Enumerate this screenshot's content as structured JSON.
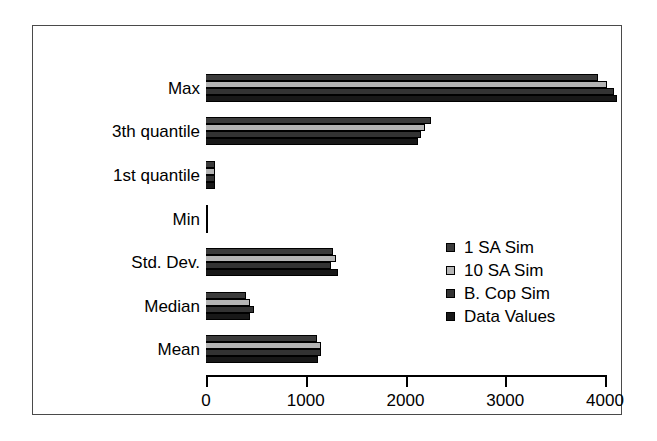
{
  "chart_data": {
    "type": "bar",
    "orientation": "horizontal",
    "title": "",
    "xlabel": "",
    "ylabel": "",
    "xlim": [
      0,
      4000
    ],
    "xticks": [
      0,
      1000,
      2000,
      3000,
      4000
    ],
    "xtick_labels": [
      "0",
      "1000",
      "2000",
      "3000",
      "4000"
    ],
    "grid": false,
    "legend_position": "center-right",
    "categories": [
      "Max",
      "3th quantile",
      "1st quantile",
      "Min",
      "Std. Dev.",
      "Median",
      "Mean"
    ],
    "series": [
      {
        "name": "1 SA Sim",
        "color": "#3b3b3b",
        "values": [
          3930,
          2255,
          95,
          0,
          1270,
          400,
          1110
        ]
      },
      {
        "name": "10 SA Sim",
        "color": "#b4b4b4",
        "values": [
          4020,
          2195,
          90,
          0,
          1300,
          440,
          1150
        ]
      },
      {
        "name": "B. Cop Sim",
        "color": "#333333",
        "values": [
          4090,
          2155,
          90,
          0,
          1250,
          480,
          1150
        ]
      },
      {
        "name": "Data Values",
        "color": "#181818",
        "values": [
          4120,
          2125,
          95,
          0,
          1320,
          440,
          1120
        ]
      }
    ]
  },
  "legend": {
    "items": [
      {
        "label": "1 SA Sim"
      },
      {
        "label": "10 SA Sim"
      },
      {
        "label": "B. Cop Sim"
      },
      {
        "label": "Data Values"
      }
    ]
  },
  "axis": {
    "x_tick_labels": [
      "0",
      "1000",
      "2000",
      "3000",
      "4000"
    ]
  },
  "categories": {
    "labels": [
      "Max",
      "3th quantile",
      "1st quantile",
      "Min",
      "Std. Dev.",
      "Median",
      "Mean"
    ]
  }
}
